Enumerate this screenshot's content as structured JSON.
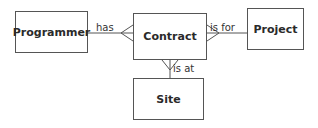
{
  "entities": {
    "programmer": "Programmer",
    "contract": "Contract",
    "project": "Project",
    "site": "Site"
  },
  "relationships": {
    "programmer_contract": "has",
    "contract_project": "is for",
    "contract_site": "is at"
  },
  "colors": {
    "line": "#555555",
    "text": "#2a2a2a"
  }
}
